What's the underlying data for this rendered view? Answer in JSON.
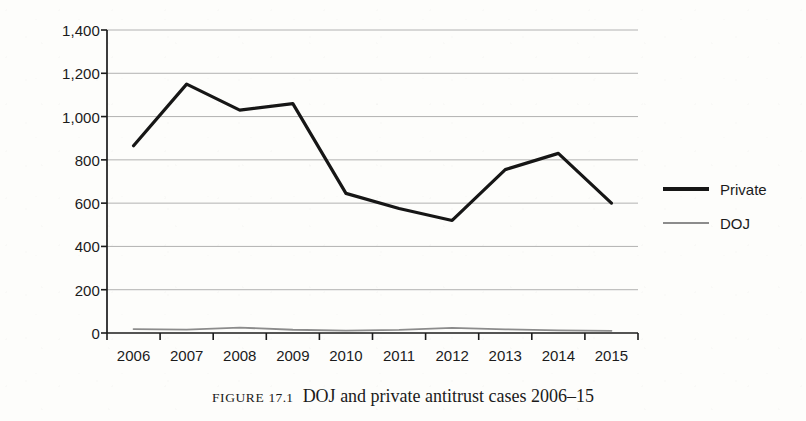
{
  "chart_data": {
    "type": "line",
    "title": "",
    "xlabel": "",
    "ylabel": "",
    "categories": [
      "2006",
      "2007",
      "2008",
      "2009",
      "2010",
      "2011",
      "2012",
      "2013",
      "2014",
      "2015"
    ],
    "series": [
      {
        "name": "Private",
        "color": "#161616",
        "line_width": 3.2,
        "values": [
          865,
          1150,
          1030,
          1060,
          645,
          575,
          520,
          755,
          830,
          600
        ]
      },
      {
        "name": "DOJ",
        "color": "#8c8c8c",
        "line_width": 1.8,
        "values": [
          18,
          16,
          25,
          15,
          11,
          14,
          24,
          17,
          12,
          10
        ]
      }
    ],
    "ylim": [
      0,
      1400
    ],
    "ytick_values": [
      0,
      200,
      400,
      600,
      800,
      1000,
      1200,
      1400
    ],
    "ytick_labels": [
      "0",
      "200",
      "400",
      "600",
      "800",
      "1,000",
      "1,200",
      "1,400"
    ],
    "grid": true,
    "grid_axis": "y",
    "grid_color": "#9a9a9a",
    "legend_position": "right"
  },
  "legend": {
    "entries": [
      {
        "label": "Private",
        "swatch": "thick-black-line"
      },
      {
        "label": "DOJ",
        "swatch": "thin-gray-line"
      }
    ]
  },
  "caption": {
    "label": "FIGURE",
    "number": "17.1",
    "text": "DOJ and private antitrust cases 2006–15"
  }
}
